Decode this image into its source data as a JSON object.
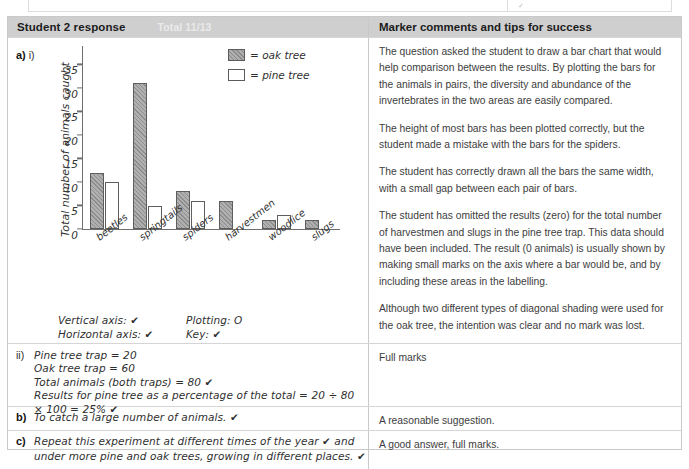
{
  "header": {
    "student_title": "Student 2 response",
    "total": "Total 11/13",
    "marker_title": "Marker comments and tips for success"
  },
  "question_a": {
    "label": "a)",
    "part": "i)",
    "annotations": [
      {
        "left": "Vertical axis: ✔",
        "right": "Plotting: O"
      },
      {
        "left": "Horizontal axis: ✔",
        "right": "Key: ✔"
      }
    ],
    "marker_comments": [
      "The question asked the student to draw a bar chart that would help comparison between the results. By plotting the bars for the animals in pairs, the diversity and abundance of the invertebrates in the two areas are easily compared.",
      "The height of most bars has been plotted correctly, but the student made a mistake with the bars for the spiders.",
      "The student has correctly drawn all the bars the same width, with a small gap between each pair of bars.",
      "The student has omitted the results (zero) for the total number of harvestmen and slugs in the pine tree trap. This data should have been included. The result (0 animals) is usually shown by making small marks on the axis where a bar would be, and by including these areas in the labelling.",
      "Although two different types of diagonal shading were used for the oak tree, the intention was clear and no mark was lost."
    ]
  },
  "question_a_ii": {
    "label": "ii)",
    "lines": [
      "Pine tree trap = 20",
      "Oak tree trap = 60",
      "Total animals (both traps) = 80 ✔",
      "Results for pine tree as a percentage of the total = 20 ÷ 80",
      "× 100 = 25% ✔"
    ],
    "marker_comment": "Full marks"
  },
  "question_b": {
    "label": "b)",
    "lines": [
      "To catch a large number of animals. ✔"
    ],
    "marker_comment": "A reasonable suggestion."
  },
  "question_c": {
    "label": "c)",
    "lines": [
      "Repeat this experiment at different times of the year ✔ and",
      "under more pine and oak trees, growing in different places. ✔"
    ],
    "marker_comment": "A good answer, full marks."
  },
  "chart_data": {
    "type": "bar",
    "title": "",
    "xlabel": "",
    "ylabel": "Total number of animals caught",
    "categories": [
      "beetles",
      "springtails",
      "spiders",
      "harvestmen",
      "woodlice",
      "slugs"
    ],
    "series": [
      {
        "name": "oak tree",
        "values": [
          12,
          31,
          8,
          6,
          2,
          2
        ]
      },
      {
        "name": "pine tree",
        "values": [
          10,
          5,
          6,
          0,
          3,
          0
        ]
      }
    ],
    "legend": [
      "= oak tree",
      "= pine tree"
    ],
    "legend_position": "top-right",
    "ylim": [
      0,
      37
    ],
    "yticks": [
      0,
      5,
      10,
      15,
      20,
      25,
      30,
      35
    ],
    "grid": false,
    "colors": {
      "oak": "#aeaeae",
      "pine": "#ffffff",
      "axis": "#6f6f6f"
    }
  },
  "theme": {
    "header_bg": "#cfcfcf",
    "border": "#c9c9c9",
    "text": "#2b2b2b"
  }
}
